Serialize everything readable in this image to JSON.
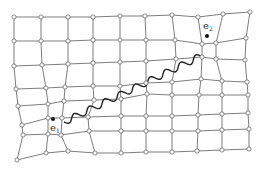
{
  "diagram": {
    "type": "deformed-lattice",
    "colors": {
      "edge": "#6e6e6e",
      "node_fill": "#ffffff",
      "wave": "#222222",
      "marker": "#111111"
    },
    "rows": [
      [
        [
          14,
          17
        ],
        [
          41,
          17
        ],
        [
          68,
          17
        ],
        [
          93,
          17
        ],
        [
          120,
          16
        ],
        [
          145,
          16
        ],
        [
          172,
          15
        ],
        [
          198,
          17
        ],
        [
          223,
          14
        ],
        [
          250,
          12
        ]
      ],
      [
        [
          14,
          41
        ],
        [
          41,
          41
        ],
        [
          68,
          41
        ],
        [
          93,
          40
        ],
        [
          120,
          40
        ],
        [
          146,
          40
        ],
        [
          175,
          40
        ],
        [
          202,
          44
        ],
        [
          216,
          43
        ],
        [
          246,
          38
        ]
      ],
      [
        [
          14,
          66
        ],
        [
          42,
          65
        ],
        [
          68,
          64
        ],
        [
          93,
          63
        ],
        [
          120,
          62
        ],
        [
          146,
          61
        ],
        [
          176,
          59
        ],
        [
          202,
          57
        ],
        [
          216,
          59
        ],
        [
          245,
          60
        ]
      ],
      [
        [
          16,
          89
        ],
        [
          46,
          88
        ],
        [
          65,
          87
        ],
        [
          93,
          86
        ],
        [
          120,
          86
        ],
        [
          146,
          83
        ],
        [
          172,
          82
        ],
        [
          201,
          79
        ],
        [
          222,
          81
        ],
        [
          247,
          82
        ]
      ],
      [
        [
          18,
          106
        ],
        [
          48,
          104
        ],
        [
          64,
          101
        ],
        [
          94,
          100
        ],
        [
          121,
          99
        ],
        [
          147,
          94
        ],
        [
          172,
          95
        ],
        [
          199,
          95
        ],
        [
          222,
          95
        ],
        [
          248,
          95
        ]
      ],
      [
        [
          22,
          125
        ],
        [
          48,
          118
        ],
        [
          62,
          118
        ],
        [
          88,
          117
        ],
        [
          121,
          116
        ],
        [
          146,
          116
        ],
        [
          172,
          116
        ],
        [
          198,
          115
        ],
        [
          222,
          114
        ],
        [
          248,
          113
        ]
      ],
      [
        [
          23,
          135
        ],
        [
          48,
          134
        ],
        [
          61,
          135
        ],
        [
          89,
          131
        ],
        [
          121,
          131
        ],
        [
          146,
          131
        ],
        [
          172,
          131
        ],
        [
          198,
          131
        ],
        [
          222,
          130
        ],
        [
          249,
          129
        ]
      ],
      [
        [
          17,
          160
        ],
        [
          46,
          153
        ],
        [
          68,
          151
        ],
        [
          95,
          153
        ],
        [
          121,
          153
        ],
        [
          146,
          152
        ],
        [
          172,
          152
        ],
        [
          197,
          151
        ],
        [
          222,
          150
        ],
        [
          249,
          149
        ]
      ]
    ],
    "labels": [
      {
        "id": "e2",
        "text": "e",
        "sub": "2",
        "x": 203,
        "y": 29,
        "dot": [
          207,
          36
        ]
      },
      {
        "id": "e1",
        "text": "e",
        "sub": "1",
        "x": 50,
        "y": 131,
        "dot": [
          53,
          119
        ]
      }
    ],
    "wave": {
      "from": [
        64,
        122
      ],
      "to": [
        201,
        56
      ],
      "waves": 9,
      "amplitude": 3.2
    }
  }
}
